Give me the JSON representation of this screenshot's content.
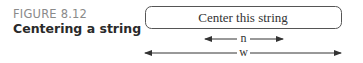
{
  "figure": {
    "number": "FIGURE 8.12",
    "title": "Centering a string"
  },
  "diagram": {
    "box_text": "Center this string",
    "inner_arrow_label": "n",
    "outer_arrow_label": "w"
  }
}
